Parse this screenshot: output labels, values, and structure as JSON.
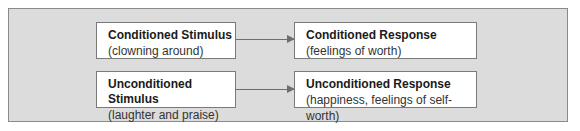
{
  "diagram": {
    "rows": [
      {
        "stimulus": {
          "title": "Conditioned Stimulus",
          "detail": "(clowning around)"
        },
        "response": {
          "title": "Conditioned Response",
          "detail": "(feelings of worth)"
        }
      },
      {
        "stimulus": {
          "title": "Unconditioned Stimulus",
          "detail": "(laughter and praise)"
        },
        "response": {
          "title": "Unconditioned Response",
          "detail": "(happiness, feelings of self-worth)"
        }
      }
    ]
  }
}
